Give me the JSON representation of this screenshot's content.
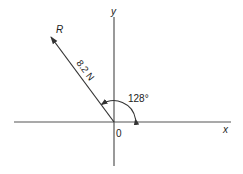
{
  "diagram": {
    "axes": {
      "x_label": "x",
      "y_label": "y",
      "origin_label": "0"
    },
    "vector": {
      "name": "R",
      "magnitude_label": "8.2 N",
      "angle_label": "128°",
      "angle_deg": 128
    },
    "colors": {
      "line": "#333333",
      "text": "#222222",
      "background": "#ffffff"
    }
  }
}
